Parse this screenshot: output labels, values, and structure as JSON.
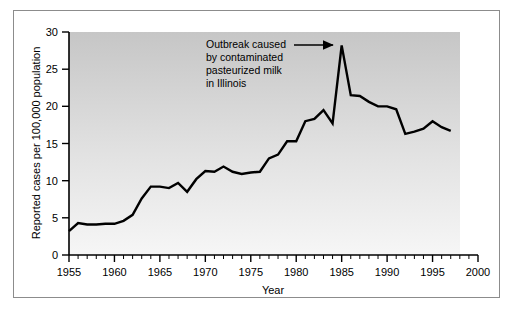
{
  "figure": {
    "frame_border_color": "#8c8c8c",
    "background_color": "#ffffff",
    "plot_gradient_top": "#c9c9c9",
    "plot_gradient_bottom": "#f4f4f4",
    "line_color": "#000000",
    "axis_color": "#000000"
  },
  "chart_data": {
    "type": "line",
    "title": "",
    "xlabel": "Year",
    "ylabel": "Reported cases per 100,000 population",
    "xlim": [
      1955,
      2000
    ],
    "ylim": [
      0,
      30
    ],
    "xticks": [
      1955,
      1960,
      1965,
      1970,
      1975,
      1980,
      1985,
      1990,
      1995,
      2000
    ],
    "xtick_labels": [
      "1955",
      "1960",
      "1965",
      "1970",
      "1975",
      "1980",
      "1985",
      "1990",
      "1995",
      "2000"
    ],
    "yticks": [
      0,
      5,
      10,
      15,
      20,
      25,
      30
    ],
    "ytick_labels": [
      "0",
      "5",
      "10",
      "15",
      "20",
      "25",
      "30"
    ],
    "minor_xtick_interval": 1,
    "grid": false,
    "legend": null,
    "x": [
      1955,
      1956,
      1957,
      1958,
      1959,
      1960,
      1961,
      1962,
      1963,
      1964,
      1965,
      1966,
      1967,
      1968,
      1969,
      1970,
      1971,
      1972,
      1973,
      1974,
      1975,
      1976,
      1977,
      1978,
      1979,
      1980,
      1981,
      1982,
      1983,
      1984,
      1985,
      1986,
      1987,
      1988,
      1989,
      1990,
      1991,
      1992,
      1993,
      1994,
      1995,
      1996,
      1997
    ],
    "values": [
      3.2,
      4.3,
      4.1,
      4.1,
      4.2,
      4.2,
      4.6,
      5.4,
      7.6,
      9.2,
      9.2,
      9.0,
      9.7,
      8.5,
      10.2,
      11.3,
      11.2,
      11.9,
      11.2,
      10.9,
      11.1,
      11.2,
      13.0,
      13.5,
      15.3,
      15.3,
      18.0,
      18.3,
      19.5,
      17.7,
      28.2,
      21.5,
      21.4,
      20.6,
      20.0,
      20.0,
      19.6,
      16.3,
      16.6,
      17.0,
      18.0,
      17.2,
      16.7
    ],
    "annotations": [
      {
        "name": "outbreak-annotation",
        "lines": [
          "Outbreak caused",
          "by contaminated",
          "pasteurized milk",
          "in Illinois"
        ],
        "arrow": {
          "points_to_year": 1985,
          "points_to_value": 28.2,
          "direction": "right"
        }
      }
    ]
  }
}
